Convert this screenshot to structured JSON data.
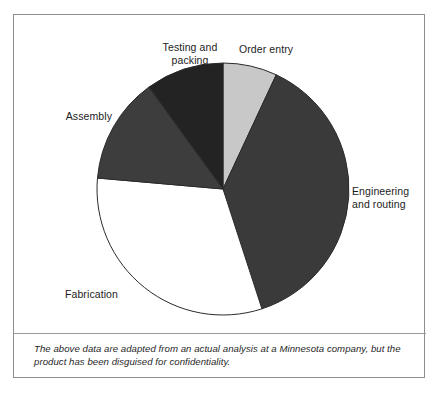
{
  "figure": {
    "caption": "The above data are adapted from an actual analysis at a Minnesota company, but the product has been disguised for confidentiality.",
    "footer_partial": ""
  },
  "chart_data": {
    "type": "pie",
    "title": "",
    "subtitle": "",
    "xlabel": "",
    "ylabel": "",
    "legend_position": "none",
    "grid": false,
    "labels_placement": "outside-callout",
    "start_angle_deg": 0,
    "direction": "clockwise",
    "center_px": [
      222,
      188
    ],
    "radius_px": 126,
    "categories": [
      "Order entry",
      "Engineering and routing",
      "Fabrication",
      "Assembly",
      "Testing and packing"
    ],
    "values": [
      7,
      38,
      31,
      14,
      10
    ],
    "unit": "percent",
    "slices": [
      {
        "label": "Order entry",
        "label_lines": "Order entry",
        "value": 7,
        "start_deg": 0,
        "end_deg": 25,
        "color": "#c8c8c8",
        "stroke": "#2b2b2b"
      },
      {
        "label": "Engineering and routing",
        "label_lines": "Engineering\nand routing",
        "value": 38,
        "start_deg": 25,
        "end_deg": 162,
        "color": "#3a3a3a",
        "stroke": "#2b2b2b"
      },
      {
        "label": "Fabrication",
        "label_lines": "Fabrication",
        "value": 31,
        "start_deg": 162,
        "end_deg": 275,
        "color": "#ffffff",
        "stroke": "#2b2b2b"
      },
      {
        "label": "Assembly",
        "label_lines": "Assembly",
        "value": 14,
        "start_deg": 275,
        "end_deg": 324,
        "color": "#3d3d3d",
        "stroke": "#2b2b2b"
      },
      {
        "label": "Testing and packing",
        "label_lines": "Testing and\npacking",
        "value": 10,
        "start_deg": 324,
        "end_deg": 360,
        "color": "#232323",
        "stroke": "#2b2b2b"
      }
    ],
    "colors": {
      "order_entry": "#c8c8c8",
      "engineering_and_routing": "#3a3a3a",
      "fabrication": "#ffffff",
      "assembly": "#3d3d3d",
      "testing_and_packing": "#232323",
      "outline": "#2b2b2b",
      "frame": "#8d8d8d",
      "background": "#ffffff"
    }
  }
}
